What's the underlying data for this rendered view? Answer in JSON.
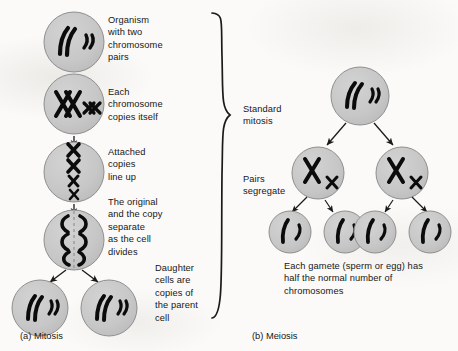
{
  "figure": {
    "title_visible": false,
    "background_hex": "#fbfaf8",
    "cell_fill_hex": "#c8c8c8",
    "cell_stroke_hex": "#8a8a8a",
    "chromosome_hex": "#000000",
    "arrow_hex": "#1a1a1a"
  },
  "panels": [
    {
      "id": "mitosis",
      "caption": "(a) Mitosis",
      "steps": [
        {
          "label": "Organism\nwith two\nchromosome\npairs",
          "stage": "parent-cell",
          "cell_count": 1,
          "chromosome_description": "two long curved chromosomes and two short curved chromosomes"
        },
        {
          "label": "Each\nchromosome\ncopies itself",
          "stage": "replication",
          "cell_count": 1,
          "chromosome_description": "duplicated chromosomes shown as paired X shapes, long pair and short pair"
        },
        {
          "label": "Attached\ncopies\nline up",
          "stage": "metaphase",
          "cell_count": 1,
          "chromosome_description": "four X-shaped chromosomes stacked vertically on the metaphase plate"
        },
        {
          "label": "The original\nand the copy\nseparate\nas the cell\ndivides",
          "stage": "anaphase",
          "cell_count": 1,
          "chromosome_description": "chromatids pulled to opposite poles, dashed division line down the middle"
        },
        {
          "label": "Daughter\ncells are\ncopies of\nthe parent\ncell",
          "stage": "daughter-cells",
          "cell_count": 2,
          "chromosome_description": "each daughter cell has two long and two short chromosomes, identical to parent"
        }
      ]
    },
    {
      "id": "meiosis",
      "caption": "(b) Meiosis",
      "steps": [
        {
          "label": "Standard\nmitosis",
          "stage": "parent-cell",
          "cell_count": 1,
          "chromosome_description": "two long curved chromosomes and two short curved chromosomes"
        },
        {
          "label": "Pairs\nsegregate",
          "stage": "first-division",
          "cell_count": 2,
          "chromosome_description": "each cell holds one long X chromosome and one short X chromosome"
        },
        {
          "label": "Each gamete (sperm or egg) has\nhalf the normal number of\nchromosomes",
          "stage": "gametes",
          "cell_count": 4,
          "chromosome_description": "each gamete holds one long and one short single chromosome"
        }
      ]
    }
  ],
  "brace": {
    "description": "large curly brace grouping the mitosis panel and pointing toward the meiosis panel",
    "points_to": "Standard mitosis"
  }
}
